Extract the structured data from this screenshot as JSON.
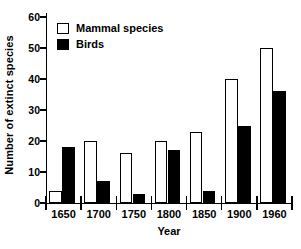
{
  "chart_data": {
    "type": "bar",
    "title": "",
    "xlabel": "Year",
    "ylabel": "Number of extinct species",
    "categories": [
      "1650",
      "1700",
      "1750",
      "1800",
      "1850",
      "1900",
      "1960"
    ],
    "series": [
      {
        "name": "Mammal species",
        "color": "#ffffff",
        "edge": "#000000",
        "values": [
          4,
          20,
          16,
          20,
          23,
          40,
          50
        ]
      },
      {
        "name": "Birds",
        "color": "#000000",
        "edge": "#000000",
        "values": [
          18,
          7,
          3,
          17,
          4,
          25,
          36
        ]
      }
    ],
    "ylim": [
      0,
      60
    ],
    "yticks": [
      0,
      10,
      20,
      30,
      40,
      50,
      60
    ],
    "ytick_labels": [
      "0",
      "10",
      "20",
      "30",
      "40",
      "50",
      "60"
    ],
    "grid": false,
    "legend_position": "top-left"
  },
  "legend": {
    "items": [
      {
        "label": "Mammal species",
        "swatch": "open-square"
      },
      {
        "label": "Birds",
        "swatch": "filled-square"
      }
    ]
  },
  "caption": {
    "text": ""
  }
}
